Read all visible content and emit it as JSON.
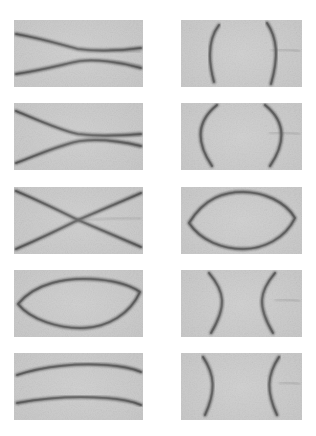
{
  "figure": {
    "title": "",
    "background_color": "#ffffff",
    "panel_background_color": "#c9c9c9",
    "curve_color": "#4f4f4f",
    "rows": 5,
    "columns": 2,
    "panel_count": 10,
    "panel_width": 129,
    "panel_height": 67,
    "panel_gap_x": 38,
    "panel_gap_y": 16
  },
  "panels": [
    {
      "id": "panel-r1c1",
      "row": 1,
      "column": 1,
      "position": {
        "x": 14,
        "y": 20,
        "w": 129,
        "h": 67
      },
      "pattern": "two-horizontal-arcs-converging",
      "description": "Two gently curved near-horizontal dark fringes bowing toward each other, weak hyperbolic pinch near the centre",
      "curves": [
        "M2,14 C30,19 52,26 64,29 C80,31 104,31 127,28",
        "M2,54 C30,50 54,43 66,41 C82,39 106,42 127,48"
      ],
      "soft_curves": [
        "M96,29 C108,30 118,31 127,32",
        "M98,41 C110,42 118,44 127,46"
      ]
    },
    {
      "id": "panel-r1c2",
      "row": 1,
      "column": 2,
      "position": {
        "x": 181,
        "y": 20,
        "w": 121,
        "h": 67
      },
      "pattern": "two-vertical-arcs-bowing-outward",
      "description": "Two vertical dark fringes curving away from each other like opposed parentheses",
      "curves": [
        "M38,5 C28,18 26,36 33,62",
        "M86,3 C96,18 98,36 90,64"
      ],
      "soft_curves": [
        "M90,30 C102,29 110,30 119,31"
      ]
    },
    {
      "id": "panel-r2c1",
      "row": 2,
      "column": 1,
      "position": {
        "x": 14,
        "y": 103,
        "w": 129,
        "h": 67
      },
      "pattern": "hyperbola-near-pinch",
      "description": "Two fringes forming a strong hyperbolic waist, almost touching at the centre",
      "curves": [
        "M2,8 C26,18 48,28 64,31 C80,33 104,33 127,31",
        "M2,60 C26,51 48,41 66,38 C82,36 106,38 127,43"
      ],
      "soft_curves": [
        "M92,31 C104,31 114,32 127,33",
        "M94,38 C106,39 114,41 127,44"
      ]
    },
    {
      "id": "panel-r2c2",
      "row": 2,
      "column": 2,
      "position": {
        "x": 181,
        "y": 103,
        "w": 121,
        "h": 67
      },
      "pattern": "two-vertical-arcs-bowing-outward-strong",
      "description": "Two strongly bowed vertical fringes nearly meeting at top and bottom",
      "curves": [
        "M36,2 C16,18 14,38 31,63",
        "M84,2 C104,18 106,38 89,63"
      ],
      "soft_curves": [
        "M88,30 C100,29 110,30 119,31"
      ]
    },
    {
      "id": "panel-r3c1",
      "row": 3,
      "column": 1,
      "position": {
        "x": 14,
        "y": 187,
        "w": 129,
        "h": 67
      },
      "pattern": "x-crossing-degenerate",
      "description": "Critical degenerate case: the two branches cross to form a full X spanning the panel corners",
      "curves": [
        "M2,4 C30,16 52,27 64,33 C80,40 104,50 127,60",
        "M2,62 C30,50 52,39 64,33 C80,26 104,16 127,6"
      ],
      "soft_curves": [
        "M66,33 C86,32 106,31 127,31"
      ]
    },
    {
      "id": "panel-r3c2",
      "row": 3,
      "column": 2,
      "position": {
        "x": 181,
        "y": 187,
        "w": 121,
        "h": 67
      },
      "pattern": "closed-lens-ellipse",
      "description": "A single closed lens-shaped fringe, pointed at left and right extremes",
      "curves": [
        "M8,36 C24,10 44,5 62,5 C82,5 104,14 114,31 C104,52 82,62 62,62 C42,62 20,54 8,36 Z"
      ],
      "soft_curves": []
    },
    {
      "id": "panel-r4c1",
      "row": 4,
      "column": 1,
      "position": {
        "x": 14,
        "y": 270,
        "w": 129,
        "h": 67
      },
      "pattern": "wide-flattened-ellipse",
      "description": "A wide flattened closed ellipse spanning almost the full panel width",
      "curves": [
        "M4,34 C22,12 54,8 76,9 C98,10 116,15 126,22 C116,44 94,57 70,58 C44,59 16,49 4,34 Z"
      ],
      "soft_curves": []
    },
    {
      "id": "panel-r4c2",
      "row": 4,
      "column": 2,
      "position": {
        "x": 181,
        "y": 270,
        "w": 121,
        "h": 67
      },
      "pattern": "two-vertical-arcs-bowing-inward",
      "description": "Two vertical fringes curving inward toward each other with vertices near mid-panel",
      "curves": [
        "M28,3 C44,22 46,36 30,63",
        "M94,3 C78,22 76,36 92,63"
      ],
      "soft_curves": [
        "M94,30 C104,29 112,30 119,31"
      ]
    },
    {
      "id": "panel-r5c1",
      "row": 5,
      "column": 1,
      "position": {
        "x": 14,
        "y": 353,
        "w": 129,
        "h": 67
      },
      "pattern": "two-horizontal-arcs-diverging",
      "description": "Two nearly parallel gentle fringes bowing apart, an opened-up ellipse",
      "curves": [
        "M3,22 C30,13 64,10 92,12 C108,13 120,16 127,19",
        "M3,50 C30,45 64,43 92,45 C108,46 120,49 127,52"
      ],
      "soft_curves": [
        "M100,13 C112,14 120,16 127,18"
      ]
    },
    {
      "id": "panel-r5c2",
      "row": 5,
      "column": 2,
      "position": {
        "x": 181,
        "y": 353,
        "w": 121,
        "h": 67
      },
      "pattern": "two-vertical-arcs-bowing-inward-wide",
      "description": "Two widely separated vertical fringes gently bowing inward",
      "curves": [
        "M22,4 C34,22 35,38 24,62",
        "M98,4 C86,22 85,38 96,62"
      ],
      "soft_curves": [
        "M98,30 C106,29 113,30 119,31"
      ]
    }
  ]
}
